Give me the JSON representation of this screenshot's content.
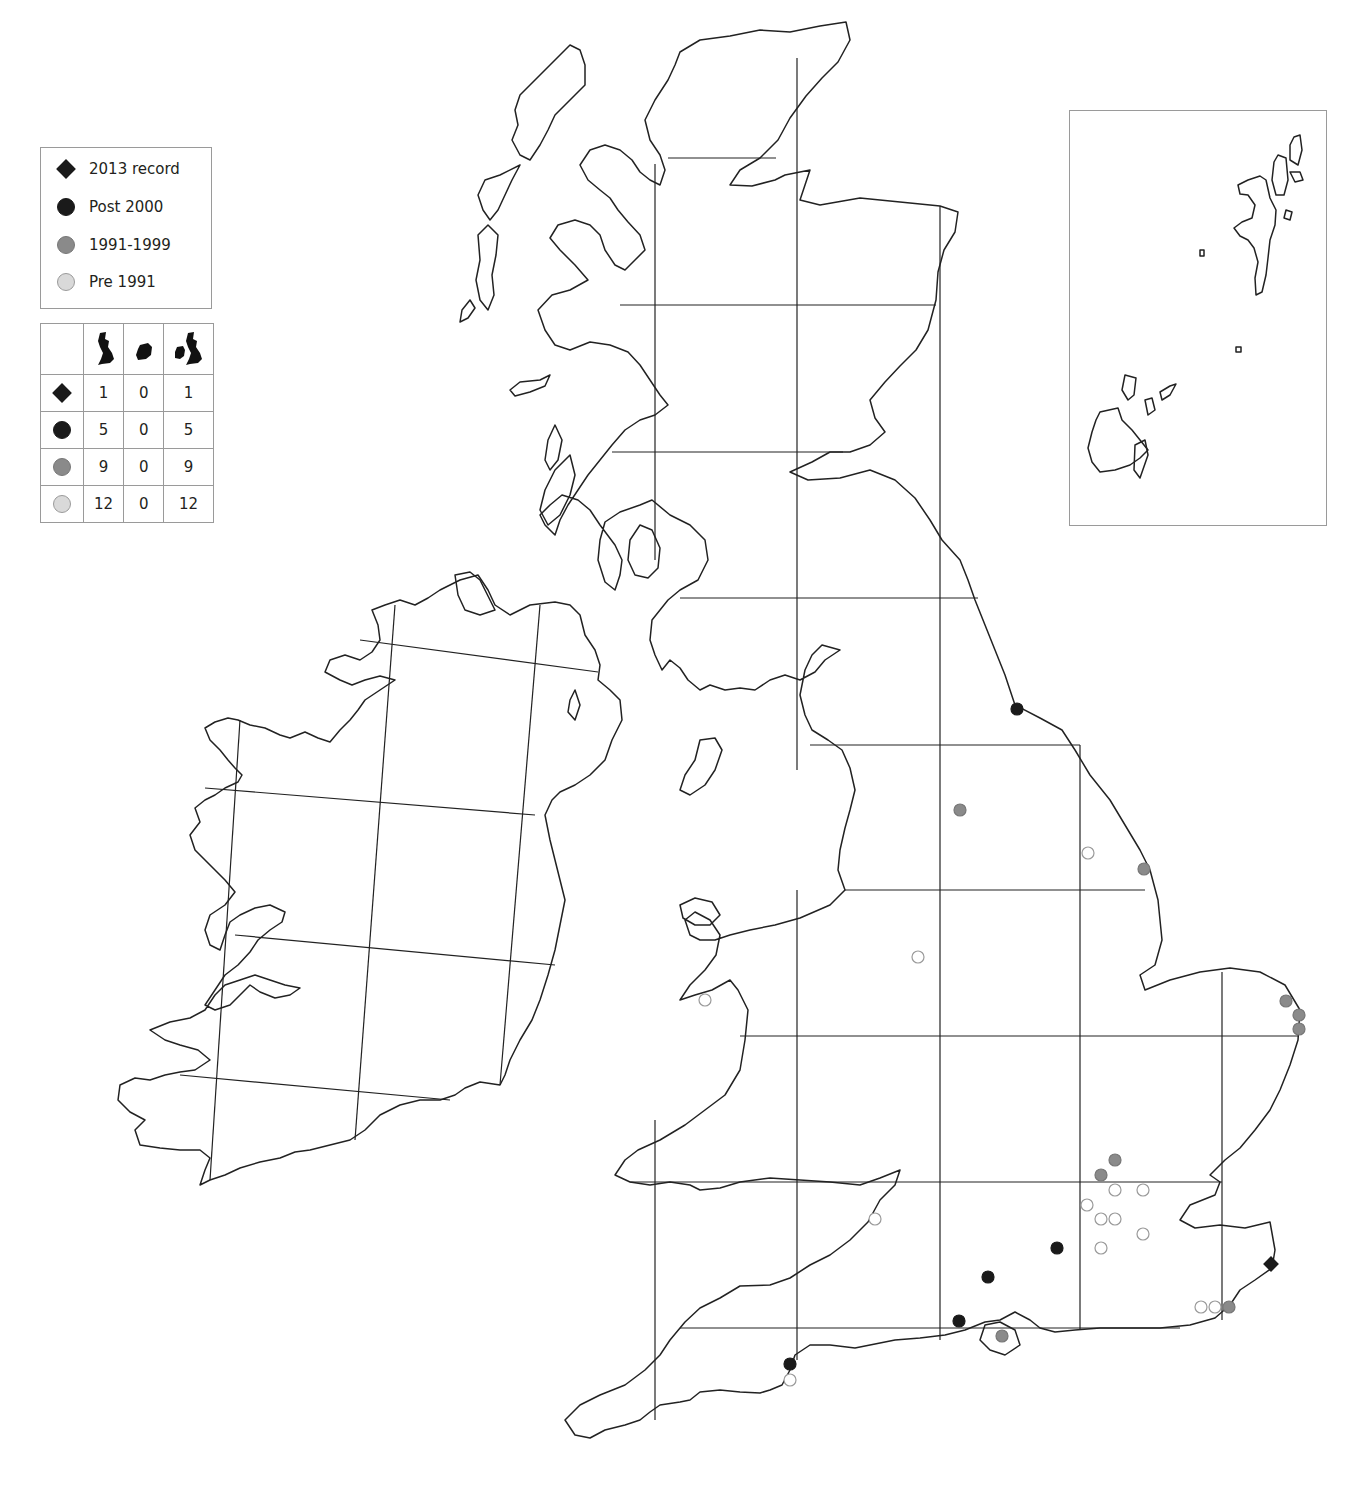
{
  "legend": {
    "items": [
      {
        "key": "2013",
        "label": "2013 record",
        "symbol": "diamond",
        "fill": "#1a1a1a",
        "stroke": "#1a1a1a"
      },
      {
        "key": "post2000",
        "label": "Post 2000",
        "symbol": "circle",
        "fill": "#1a1a1a",
        "stroke": "#1a1a1a"
      },
      {
        "key": "1991_1999",
        "label": "1991-1999",
        "symbol": "circle",
        "fill": "#8a8a8a",
        "stroke": "#777777"
      },
      {
        "key": "pre1991",
        "label": "Pre 1991",
        "symbol": "circle",
        "fill": "#d9d9d9",
        "stroke": "#9a9a9a"
      }
    ]
  },
  "counts_table": {
    "columns": [
      {
        "key": "gb",
        "icon": "great-britain-map-icon"
      },
      {
        "key": "ireland",
        "icon": "ireland-map-icon"
      },
      {
        "key": "total",
        "icon": "britain-and-ireland-map-icon"
      }
    ],
    "rows": [
      {
        "symbol": "2013",
        "gb": "1",
        "ireland": "0",
        "total": "1"
      },
      {
        "symbol": "post2000",
        "gb": "5",
        "ireland": "0",
        "total": "5"
      },
      {
        "symbol": "1991_1999",
        "gb": "9",
        "ireland": "0",
        "total": "9"
      },
      {
        "symbol": "pre1991",
        "gb": "12",
        "ireland": "0",
        "total": "12"
      }
    ]
  },
  "inset": {
    "content": "Orkney and Shetland"
  },
  "map_data": {
    "type": "distribution-map",
    "region": "Britain and Ireland",
    "grid": "100 km squares",
    "points": [
      {
        "x": 1017,
        "y": 709,
        "category": "post2000"
      },
      {
        "x": 1057,
        "y": 1248,
        "category": "post2000"
      },
      {
        "x": 988,
        "y": 1277,
        "category": "post2000"
      },
      {
        "x": 959,
        "y": 1321,
        "category": "post2000"
      },
      {
        "x": 790,
        "y": 1364,
        "category": "post2000"
      },
      {
        "x": 1271,
        "y": 1264,
        "category": "2013"
      },
      {
        "x": 960,
        "y": 810,
        "category": "1991_1999"
      },
      {
        "x": 1144,
        "y": 869,
        "category": "1991_1999"
      },
      {
        "x": 1286,
        "y": 1001,
        "category": "1991_1999"
      },
      {
        "x": 1299,
        "y": 1015,
        "category": "1991_1999"
      },
      {
        "x": 1299,
        "y": 1029,
        "category": "1991_1999"
      },
      {
        "x": 1115,
        "y": 1160,
        "category": "1991_1999"
      },
      {
        "x": 1101,
        "y": 1175,
        "category": "1991_1999"
      },
      {
        "x": 1229,
        "y": 1307,
        "category": "1991_1999"
      },
      {
        "x": 1002,
        "y": 1336,
        "category": "1991_1999"
      },
      {
        "x": 1088,
        "y": 853,
        "category": "pre1991"
      },
      {
        "x": 918,
        "y": 957,
        "category": "pre1991"
      },
      {
        "x": 705,
        "y": 1000,
        "category": "pre1991"
      },
      {
        "x": 875,
        "y": 1219,
        "category": "pre1991"
      },
      {
        "x": 1115,
        "y": 1190,
        "category": "pre1991"
      },
      {
        "x": 1143,
        "y": 1190,
        "category": "pre1991"
      },
      {
        "x": 1087,
        "y": 1205,
        "category": "pre1991"
      },
      {
        "x": 1101,
        "y": 1219,
        "category": "pre1991"
      },
      {
        "x": 1115,
        "y": 1219,
        "category": "pre1991"
      },
      {
        "x": 1143,
        "y": 1234,
        "category": "pre1991"
      },
      {
        "x": 1101,
        "y": 1248,
        "category": "pre1991"
      },
      {
        "x": 1201,
        "y": 1307,
        "category": "pre1991"
      },
      {
        "x": 1215,
        "y": 1307,
        "category": "pre1991"
      },
      {
        "x": 790,
        "y": 1380,
        "category": "pre1991"
      }
    ]
  }
}
